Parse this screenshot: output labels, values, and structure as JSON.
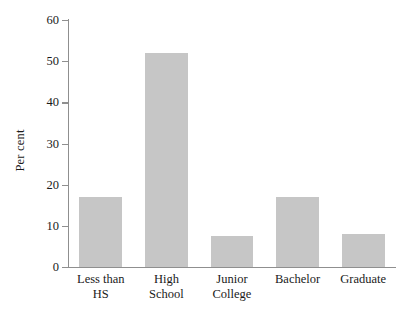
{
  "chart_data": {
    "type": "bar",
    "title": "",
    "xlabel": "",
    "ylabel": "Per cent",
    "categories": [
      "Less than HS",
      "High School",
      "Junior College",
      "Bachelor",
      "Graduate"
    ],
    "category_labels_wrapped": [
      "Less than\nHS",
      "High\nSchool",
      "Junior\nCollege",
      "Bachelor",
      "Graduate"
    ],
    "values": [
      17,
      52,
      7.5,
      17,
      8
    ],
    "ylim": [
      0,
      60
    ],
    "ytick_labels": [
      "0",
      "10",
      "20",
      "30",
      "40",
      "50",
      "60"
    ],
    "ytick_values": [
      0,
      10,
      20,
      30,
      40,
      50,
      60
    ],
    "grid": false,
    "legend": false,
    "bar_color": "#c6c6c6",
    "axis_color": "#8f8f8f",
    "text_color": "#1a1a1a"
  }
}
